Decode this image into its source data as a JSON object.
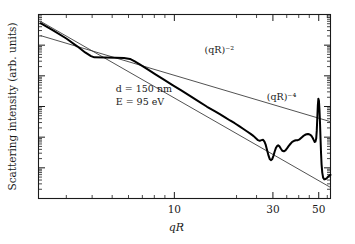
{
  "figure": {
    "background_color": "#ffffff",
    "foreground_color": "#1a1a1a",
    "curve_color": "#000000",
    "guide_color": "#333333"
  },
  "chart_data": {
    "type": "line",
    "title": "",
    "xlabel": "qR",
    "ylabel": "Scattering intensity (arb. units)",
    "xscale": "log",
    "yscale": "log",
    "xlim": [
      2.2,
      57
    ],
    "ylim": [
      1e-06,
      1.0
    ],
    "grid": false,
    "legend": "none",
    "xticks_labeled": [
      {
        "value": 10,
        "label": "10"
      },
      {
        "value": 30,
        "label": "30"
      },
      {
        "value": 50,
        "label": "50"
      }
    ],
    "xticks_minor": [
      3,
      4,
      5,
      6,
      7,
      8,
      9,
      20,
      40,
      60,
      70,
      80,
      90
    ],
    "yticks_labeled": [],
    "yticks_major_decades": 6,
    "annotations": [
      {
        "name": "power-law-2",
        "text": "(qR)⁻²",
        "x": 14.0,
        "y": 0.055
      },
      {
        "name": "power-law-4",
        "text": "(qR)⁻⁴",
        "x": 28.0,
        "y": 0.0016
      },
      {
        "name": "sample-thickness",
        "text": "d = 150 nm",
        "x": 5.2,
        "y": 0.003
      },
      {
        "name": "beam-energy",
        "text": "E = 95 eV",
        "x": 5.2,
        "y": 0.0011
      }
    ],
    "series": [
      {
        "name": "measured-scattering-intensity",
        "style": "thick-solid",
        "x": [
          2.25,
          2.6,
          3.0,
          3.4,
          3.7,
          3.95,
          4.1,
          4.6,
          5.2,
          5.7,
          6.1,
          6.4,
          6.8,
          7.4,
          8.1,
          8.9,
          9.8,
          10.8,
          11.9,
          13.1,
          14.4,
          15.6,
          16.6,
          17.6,
          18.6,
          19.6,
          20.6,
          21.6,
          22.6,
          23.4,
          24.2,
          24.9,
          25.4,
          25.9,
          26.4,
          26.9,
          27.3,
          27.7,
          28.1,
          28.6,
          29.0,
          29.4,
          29.8,
          30.2,
          30.6,
          31.0,
          31.4,
          31.8,
          32.3,
          32.8,
          33.3,
          33.9,
          34.5,
          35.1,
          35.8,
          36.5,
          37.2,
          38.0,
          38.8,
          39.6,
          40.4,
          41.2,
          42.0,
          42.8,
          43.6,
          44.4,
          45.2,
          46.0,
          46.7,
          47.3,
          47.8,
          48.2,
          48.6,
          48.9,
          49.2,
          49.5,
          49.8,
          50.1,
          50.4,
          50.7,
          51.0,
          51.3,
          51.6,
          52.0,
          52.5,
          53.2,
          54.0,
          54.8,
          55.6,
          56.4,
          57.0
        ],
        "y": [
          0.52,
          0.3,
          0.165,
          0.09,
          0.058,
          0.044,
          0.04,
          0.0395,
          0.0388,
          0.0382,
          0.0355,
          0.03,
          0.0235,
          0.0165,
          0.0112,
          0.0075,
          0.005,
          0.00335,
          0.00222,
          0.00148,
          0.00098,
          0.00072,
          0.00056,
          0.00044,
          0.00035,
          0.000285,
          0.00023,
          0.000185,
          0.00015,
          0.000128,
          0.000108,
          9e-05,
          8e-05,
          7.6e-05,
          8e-05,
          8.2e-05,
          7.2e-05,
          5.6e-05,
          3.8e-05,
          2.45e-05,
          1.9e-05,
          1.78e-05,
          1.95e-05,
          2.5e-05,
          3.4e-05,
          4.4e-05,
          5.1e-05,
          5.4e-05,
          5e-05,
          4.2e-05,
          3.6e-05,
          3.45e-05,
          3.7e-05,
          4.3e-05,
          5.2e-05,
          6.1e-05,
          7e-05,
          7.6e-05,
          7.9e-05,
          8e-05,
          8.5e-05,
          9.6e-05,
          0.000108,
          0.000118,
          0.000124,
          0.000126,
          0.000122,
          0.000112,
          9.6e-05,
          8e-05,
          7e-05,
          7.2e-05,
          9e-05,
          0.00016,
          0.00042,
          0.0011,
          0.0018,
          0.00155,
          0.0008,
          0.0003,
          9e-05,
          3e-05,
          1.3e-05,
          7e-06,
          4.8e-06,
          4.2e-06,
          4.3e-06,
          4.7e-06,
          5.2e-06,
          5.6e-06,
          5.9e-06
        ]
      },
      {
        "name": "guide-line-qR-power-minus-2",
        "style": "thin-solid",
        "label": "(qR)⁻²",
        "exponent": -2,
        "x": [
          2.25,
          57.0
        ],
        "y": [
          0.205,
          0.00032
        ]
      },
      {
        "name": "guide-line-qR-power-minus-4",
        "style": "thin-solid",
        "label": "(qR)⁻⁴",
        "exponent": -4,
        "x": [
          2.25,
          57.0
        ],
        "y": [
          0.6,
          2.3e-06
        ]
      }
    ]
  }
}
